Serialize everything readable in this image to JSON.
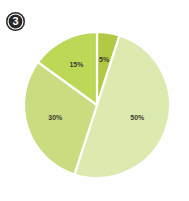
{
  "badge": {
    "number": "3",
    "background_color": "#272727",
    "text_color": "#ffffff"
  },
  "canvas": {
    "background_color": "#fefefe",
    "width": 189,
    "height": 201
  },
  "chart_data": {
    "type": "pie",
    "title": "",
    "subtitle": "",
    "xlabel": "",
    "ylabel": "",
    "legend_position": "none",
    "grid": false,
    "start_angle_deg": 0,
    "direction": "clockwise",
    "center": {
      "x": 97,
      "y": 105
    },
    "radius": 73,
    "separator_color": "#ffffff",
    "separator_width": 2.2,
    "label_color": "#3a3a32",
    "categories": [
      "5%",
      "50%",
      "30%",
      "15%"
    ],
    "values": [
      5,
      50,
      30,
      15
    ],
    "slices": [
      {
        "label": "5%",
        "value": 5,
        "color": "#b2c944",
        "label_radius_frac": 0.62,
        "label_dx": 0,
        "label_dy": 0
      },
      {
        "label": "50%",
        "value": 50,
        "color": "#dcea af",
        "label_radius_frac": 0.58,
        "label_dx": 0,
        "label_dy": 0
      },
      {
        "label": "30%",
        "value": 30,
        "color": "#c9dc80",
        "label_radius_frac": 0.6,
        "label_dx": 0,
        "label_dy": 0
      },
      {
        "label": "15%",
        "value": 15,
        "color": "#bdd757",
        "label_radius_frac": 0.62,
        "label_dx": 0,
        "label_dy": 0
      }
    ],
    "colors": [
      "#b2c944",
      "#dceaaf",
      "#c9dc80",
      "#bdd757"
    ]
  }
}
